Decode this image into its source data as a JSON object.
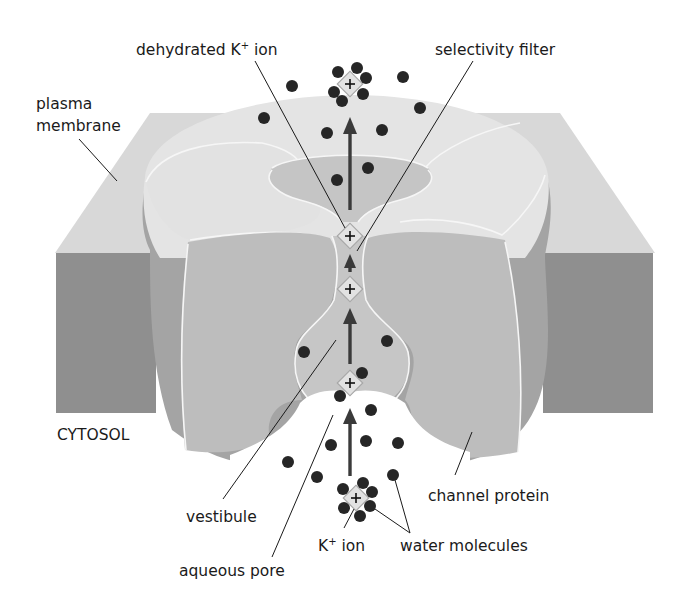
{
  "diagram": {
    "labels": {
      "dehydrated_ion": "dehydrated K",
      "dehydrated_ion_sup": "+",
      "dehydrated_ion_suffix": " ion",
      "selectivity_filter": "selectivity filter",
      "plasma_membrane_line1": "plasma",
      "plasma_membrane_line2": "membrane",
      "cytosol": "CYTOSOL",
      "vestibule": "vestibule",
      "aqueous_pore": "aqueous pore",
      "channel_protein": "channel protein",
      "k_ion": "K",
      "k_ion_sup": "+",
      "k_ion_suffix": " ion",
      "water_molecules": "water molecules"
    },
    "ion_symbol": "+",
    "colors": {
      "background": "#ffffff",
      "membrane_top": "#d9d9d9",
      "membrane_side": "#8e8e8e",
      "protein_top": "#e3e3e3",
      "protein_cut_face": "#bdbdbd",
      "protein_outer_wall": "#a3a3a3",
      "pore_inner": "#c6c6c6",
      "water_molecule": "#262626",
      "ion_fill": "#e2e2e2",
      "arrow": "#3a3a3a"
    }
  }
}
